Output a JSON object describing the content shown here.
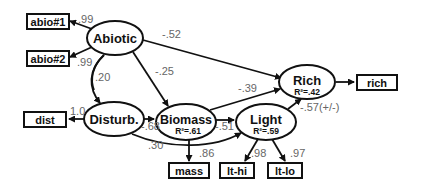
{
  "diagram": {
    "type": "structural-equation-model",
    "latent_nodes": [
      {
        "id": "abiotic",
        "label": "Abiotic"
      },
      {
        "id": "disturb",
        "label": "Disturb."
      },
      {
        "id": "biomass",
        "label": "Biomass",
        "r2": "R²=.61"
      },
      {
        "id": "light",
        "label": "Light",
        "r2": "R²=.59"
      },
      {
        "id": "rich",
        "label": "Rich",
        "r2": "R²=.42"
      }
    ],
    "observed_nodes": [
      {
        "id": "abio1",
        "label": "abio#1"
      },
      {
        "id": "abio2",
        "label": "abio#2"
      },
      {
        "id": "dist",
        "label": "dist"
      },
      {
        "id": "mass",
        "label": "mass"
      },
      {
        "id": "lthi",
        "label": "lt-hi"
      },
      {
        "id": "ltlo",
        "label": "lt-lo"
      },
      {
        "id": "rich_obs",
        "label": "rich"
      }
    ],
    "paths": [
      {
        "from": "abiotic",
        "to": "abio1",
        "coef": ".99"
      },
      {
        "from": "abiotic",
        "to": "abio2",
        "coef": ".99"
      },
      {
        "from": "abiotic",
        "to": "disturb",
        "coef": ".20"
      },
      {
        "from": "abiotic",
        "to": "rich",
        "coef": "-.52"
      },
      {
        "from": "abiotic",
        "to": "biomass",
        "coef": "-.25"
      },
      {
        "from": "disturb",
        "to": "dist",
        "coef": "1.0"
      },
      {
        "from": "disturb",
        "to": "biomass",
        "coef": "-.68"
      },
      {
        "from": "disturb",
        "to": "light",
        "coef": ".30"
      },
      {
        "from": "biomass",
        "to": "rich",
        "coef": "-.39"
      },
      {
        "from": "biomass",
        "to": "light",
        "coef": "-.51"
      },
      {
        "from": "biomass",
        "to": "mass",
        "coef": ".86"
      },
      {
        "from": "light",
        "to": "rich",
        "coef": "-.57(+/-)"
      },
      {
        "from": "light",
        "to": "lthi",
        "coef": ".98"
      },
      {
        "from": "light",
        "to": "ltlo",
        "coef": ".97"
      },
      {
        "from": "rich",
        "to": "rich_obs",
        "coef": ""
      }
    ]
  }
}
